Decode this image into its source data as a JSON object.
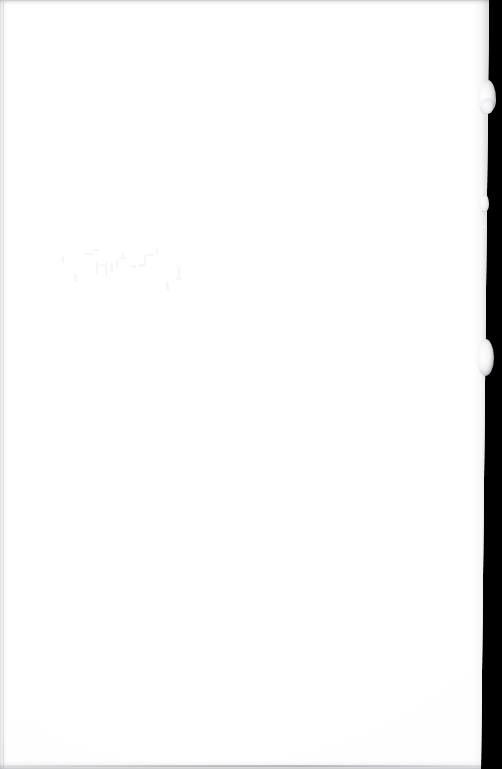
{
  "document": {
    "kind": "scanned-page",
    "page_state": "blank",
    "caption": "Blank scanned page",
    "width_px": 502,
    "height_px": 769
  },
  "scan": {
    "backdrop_label": "scanner-backdrop",
    "paper_label": "paper-sheet",
    "paper_color": "#ffffff",
    "backdrop_color": "#000000",
    "paper_tone_color": "#fdfdfe",
    "edge_shadow_color": "#787a80"
  },
  "paper_edge": {
    "style": "torn-deckle",
    "side": "right",
    "top_edge_x": 489,
    "bottom_edge_x": 481,
    "tufts": [
      {
        "name": "tuft-upper",
        "top": 80,
        "height": 34,
        "extends_to_x": 496
      },
      {
        "name": "tuft-upper-lobe",
        "top": 98,
        "height": 16,
        "extends_to_x": 493
      },
      {
        "name": "tuft-middle",
        "top": 194,
        "height": 19,
        "extends_to_x": 489
      },
      {
        "name": "tuft-lower",
        "top": 339,
        "height": 37,
        "extends_to_x": 494
      }
    ]
  },
  "content": {
    "text": "",
    "note": "no printed text present",
    "showthrough": {
      "present": true,
      "region": "upper-middle",
      "description": "faint ink show-through from reverse side",
      "opacity": "0.04"
    }
  }
}
